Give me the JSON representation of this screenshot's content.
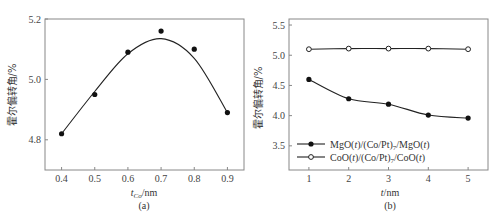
{
  "chart_data": [
    {
      "panel": "(a)",
      "type": "scatter",
      "title": "",
      "xlabel": "t_Co/nm",
      "xlabel_main": "t",
      "xlabel_sub": "Co",
      "xlabel_unit": "/nm",
      "ylabel": "霍尔偏转角/%",
      "xlim": [
        0.35,
        0.95
      ],
      "ylim": [
        4.7,
        5.2
      ],
      "xticks": [
        0.4,
        0.5,
        0.6,
        0.7,
        0.8,
        0.9
      ],
      "xtick_labels": [
        "0.4",
        "0.5",
        "0.6",
        "0.7",
        "0.8",
        "0.9"
      ],
      "yticks": [
        4.8,
        5.0,
        5.2
      ],
      "ytick_labels": [
        "4.8",
        "5.0",
        "5.2"
      ],
      "grid": false,
      "series": [
        {
          "name": "data",
          "marker": "filled-circle",
          "fit": "smooth-curve",
          "x": [
            0.4,
            0.5,
            0.6,
            0.7,
            0.8,
            0.9
          ],
          "values": [
            4.82,
            4.95,
            5.09,
            5.16,
            5.1,
            4.89
          ]
        }
      ],
      "caption": "(a)"
    },
    {
      "panel": "(b)",
      "type": "line",
      "title": "",
      "xlabel": "t/nm",
      "ylabel": "霍尔偏转角/%",
      "xlim": [
        0.5,
        5.5
      ],
      "ylim": [
        3.1,
        5.6
      ],
      "xticks": [
        1,
        2,
        3,
        4,
        5
      ],
      "xtick_labels": [
        "1",
        "2",
        "3",
        "4",
        "5"
      ],
      "yticks": [
        3.5,
        4.0,
        4.5,
        5.0,
        5.5
      ],
      "ytick_labels": [
        "3.5",
        "4.0",
        "4.5",
        "5.0",
        "5.5"
      ],
      "grid": false,
      "legend_position": "lower-left",
      "series": [
        {
          "name": "MgO(t)/(Co/Pt)7/MgO(t)",
          "marker": "filled-circle",
          "x": [
            1,
            2,
            3,
            4,
            5
          ],
          "values": [
            4.6,
            4.28,
            4.19,
            4.01,
            3.96
          ]
        },
        {
          "name": "CoO(t)/(Co/Pt)7/CoO(t)",
          "marker": "open-circle",
          "x": [
            1,
            2,
            3,
            4,
            5
          ],
          "values": [
            5.1,
            5.11,
            5.11,
            5.11,
            5.1
          ]
        }
      ],
      "caption": "(b)"
    }
  ],
  "panels": {
    "a": {
      "ylabel": "霍尔偏转角/%",
      "xlabel_main": "t",
      "xlabel_sub": "Co",
      "xlabel_unit": "/nm",
      "caption": "(a)"
    },
    "b": {
      "ylabel": "霍尔偏转角/%",
      "xlabel_main": "t",
      "xlabel_unit": "/nm",
      "caption": "(b)",
      "legend": [
        {
          "p1": "MgO(",
          "v1": "t",
          "p2": ")/(Co/Pt)",
          "sub": "7",
          "p3": "/MgO(",
          "v2": "t",
          "p4": ")"
        },
        {
          "p1": "CoO(",
          "v1": "t",
          "p2": ")/(Co/Pt)",
          "sub": "7",
          "p3": "/CoO(",
          "v2": "t",
          "p4": ")"
        }
      ]
    }
  }
}
